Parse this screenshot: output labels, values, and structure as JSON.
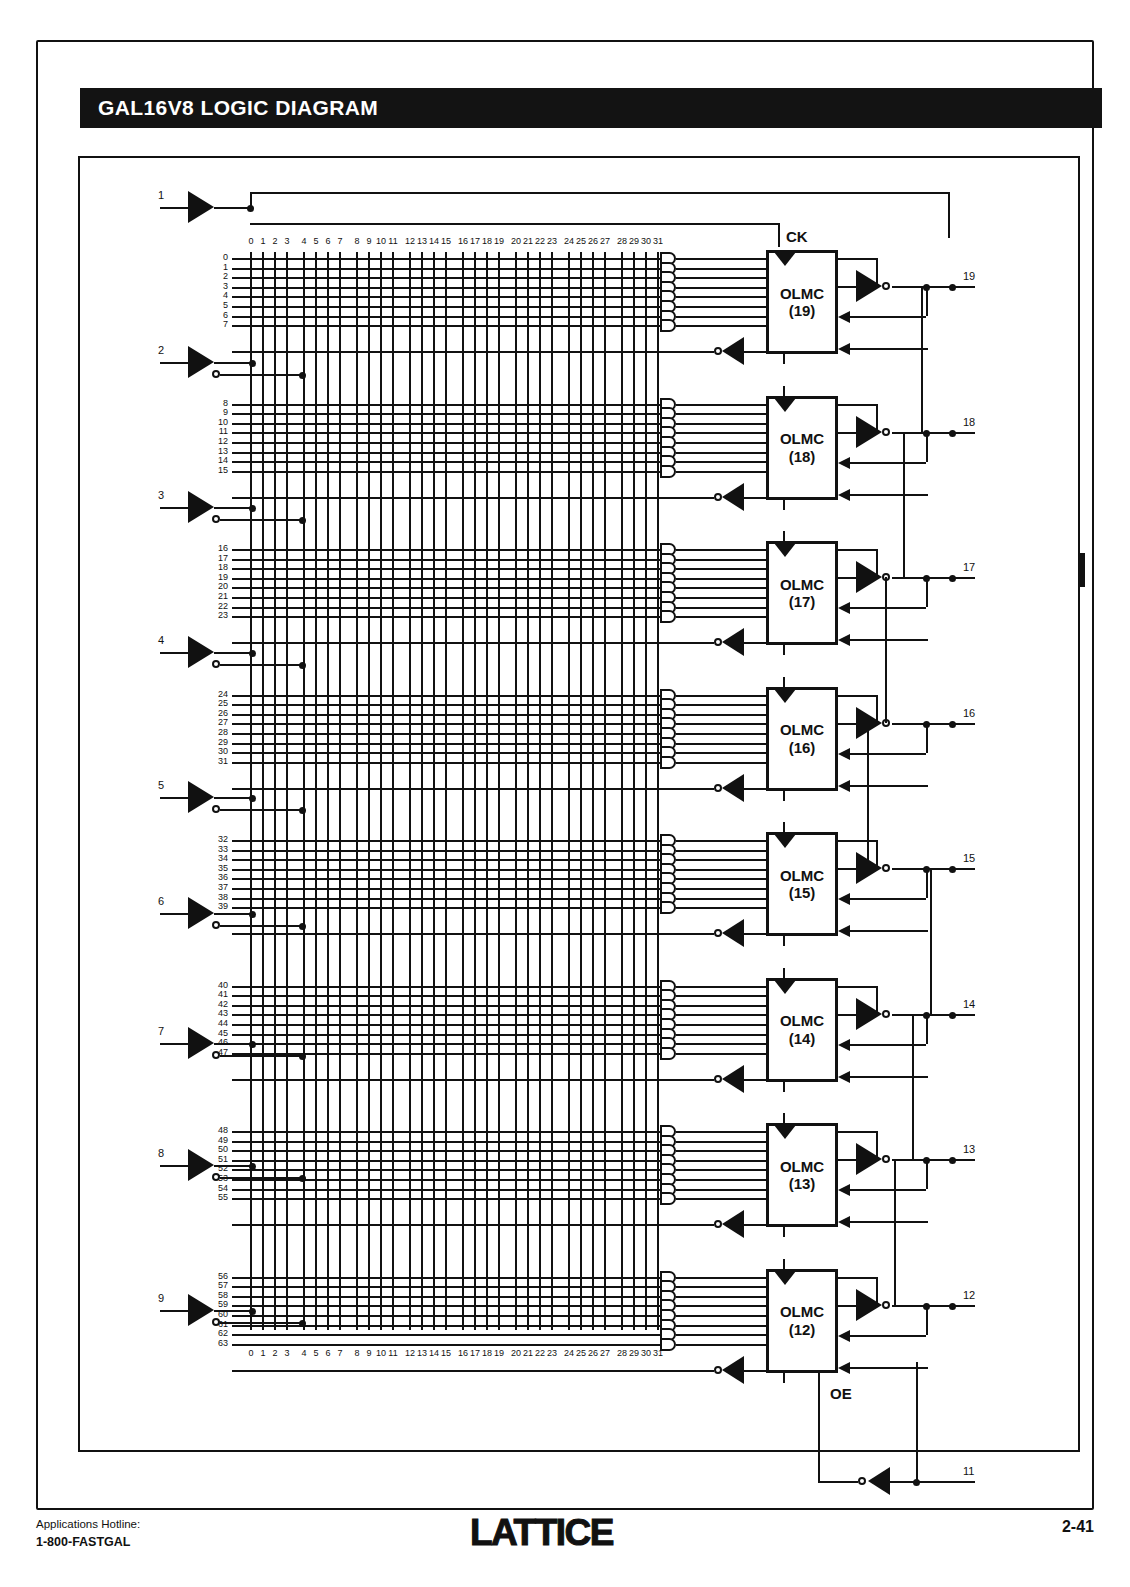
{
  "page": {
    "title": "GAL16V8 LOGIC DIAGRAM",
    "device": "GAL16V8"
  },
  "footer": {
    "hotline_label": "Applications Hotline:",
    "hotline_number": "1-800-FASTGAL",
    "logo": "LATTICE",
    "page_number": "2-41"
  },
  "diagram": {
    "clock_label": "CK",
    "oe_label": "OE",
    "column_numbers": [
      "0",
      "1",
      "2",
      "3",
      "4",
      "5",
      "6",
      "7",
      "8",
      "9",
      "10",
      "11",
      "12",
      "13",
      "14",
      "15",
      "16",
      "17",
      "18",
      "19",
      "20",
      "21",
      "22",
      "23",
      "24",
      "25",
      "26",
      "27",
      "28",
      "29",
      "30",
      "31"
    ],
    "input_pins": [
      "1",
      "2",
      "3",
      "4",
      "5",
      "6",
      "7",
      "8",
      "9"
    ],
    "output_pins": [
      "19",
      "18",
      "17",
      "16",
      "15",
      "14",
      "13",
      "12"
    ],
    "oe_pin": "11",
    "olmc_blocks": [
      {
        "name": "OLMC",
        "pin": "(19)",
        "rows": [
          "0",
          "1",
          "2",
          "3",
          "4",
          "5",
          "6",
          "7"
        ],
        "output_pin": "19"
      },
      {
        "name": "OLMC",
        "pin": "(18)",
        "rows": [
          "8",
          "9",
          "10",
          "11",
          "12",
          "13",
          "14",
          "15"
        ],
        "output_pin": "18"
      },
      {
        "name": "OLMC",
        "pin": "(17)",
        "rows": [
          "16",
          "17",
          "18",
          "19",
          "20",
          "21",
          "22",
          "23"
        ],
        "output_pin": "17"
      },
      {
        "name": "OLMC",
        "pin": "(16)",
        "rows": [
          "24",
          "25",
          "26",
          "27",
          "28",
          "29",
          "30",
          "31"
        ],
        "output_pin": "16"
      },
      {
        "name": "OLMC",
        "pin": "(15)",
        "rows": [
          "32",
          "33",
          "34",
          "35",
          "36",
          "37",
          "38",
          "39"
        ],
        "output_pin": "15"
      },
      {
        "name": "OLMC",
        "pin": "(14)",
        "rows": [
          "40",
          "41",
          "42",
          "43",
          "44",
          "45",
          "46",
          "47"
        ],
        "output_pin": "14"
      },
      {
        "name": "OLMC",
        "pin": "(13)",
        "rows": [
          "48",
          "49",
          "50",
          "51",
          "52",
          "53",
          "54",
          "55"
        ],
        "output_pin": "13"
      },
      {
        "name": "OLMC",
        "pin": "(12)",
        "rows": [
          "56",
          "57",
          "58",
          "59",
          "60",
          "61",
          "62",
          "63"
        ],
        "output_pin": "12"
      }
    ]
  },
  "colors": {
    "ink": "#111111",
    "paper": "#ffffff",
    "banner": "#131313"
  }
}
